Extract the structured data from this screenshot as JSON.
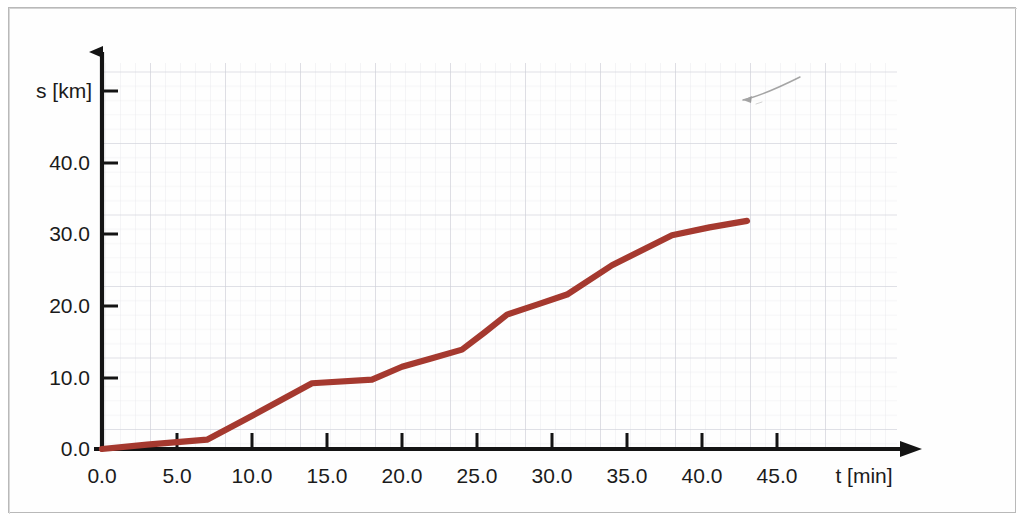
{
  "figure": {
    "background_color": "#ffffff",
    "frame_color": "#b9b9b9",
    "axis_color": "#141414",
    "grid_minor_color": "#e2e2e6",
    "grid_major_color": "#c9ccd4",
    "curve_color": "#a5392f",
    "pencil_mark_color": "#8a8a8a"
  },
  "chart_data": {
    "type": "line",
    "title": "",
    "xlabel": "t [min]",
    "ylabel": "s [km]",
    "xlim": [
      0.0,
      48.0
    ],
    "ylim": [
      0.0,
      48.0
    ],
    "grid": true,
    "legend": "none",
    "x_ticks": [
      "0.0",
      "5.0",
      "10.0",
      "15.0",
      "20.0",
      "25.0",
      "30.0",
      "35.0",
      "40.0",
      "45.0"
    ],
    "x_tick_values": [
      0.0,
      5.0,
      10.0,
      15.0,
      20.0,
      25.0,
      30.0,
      35.0,
      40.0,
      45.0
    ],
    "y_ticks": [
      "0.0",
      "10.0",
      "20.0",
      "30.0",
      "40.0"
    ],
    "y_tick_values": [
      0.0,
      10.0,
      20.0,
      30.0,
      40.0
    ],
    "series": [
      {
        "name": "s(t)",
        "color": "#a5392f",
        "x": [
          0.0,
          3.0,
          7.0,
          10.5,
          14.0,
          18.0,
          20.0,
          22.0,
          24.0,
          25.5,
          27.0,
          29.0,
          31.0,
          34.0,
          38.0,
          40.5,
          43.0
        ],
        "y": [
          0.0,
          0.6,
          1.3,
          5.2,
          9.2,
          9.7,
          11.5,
          12.7,
          13.9,
          16.3,
          18.8,
          20.2,
          21.6,
          25.7,
          29.9,
          31.0,
          31.9
        ]
      }
    ],
    "annotations": [
      {
        "name": "pencil-mark",
        "type": "freehand-stroke",
        "x_range": [
          35.5,
          40.0
        ],
        "y_range": [
          43.0,
          45.5
        ]
      }
    ]
  },
  "axis": {
    "y_axis_title": "s [km]",
    "x_axis_title": "t [min]",
    "origin_label": "0.0"
  }
}
